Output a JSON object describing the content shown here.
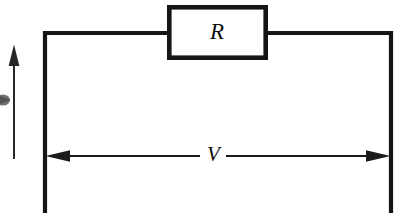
{
  "figure": {
    "kind": "circuit-diagram",
    "background_color": "#ffffff",
    "ink_color": "#151515",
    "width": 413,
    "height": 223
  },
  "components": {
    "resistor": {
      "label": "R",
      "label_style": "italic-serif",
      "shape": "rectangle",
      "x": 167,
      "y": 5,
      "width": 101,
      "height": 54
    }
  },
  "annotations": {
    "voltage": {
      "label": "V",
      "label_style": "italic-serif",
      "arrow_type": "double-headed",
      "orientation": "horizontal",
      "y": 156,
      "x_start": 45,
      "x_end": 391
    },
    "current": {
      "label": "",
      "arrow_type": "single-headed",
      "orientation": "vertical",
      "direction": "up",
      "x": 14,
      "y_top": 45,
      "y_bottom": 159
    }
  },
  "wires": {
    "left_rail_x": 45,
    "right_rail_x": 391,
    "top_rail_y": 33,
    "terminal_y": 213
  }
}
